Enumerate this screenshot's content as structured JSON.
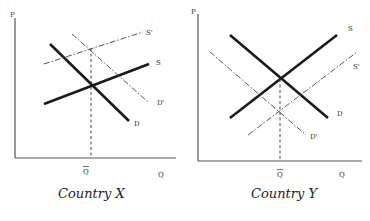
{
  "panels": [
    {
      "caption": "Country X",
      "y_axis_label": "P",
      "x_axis_label": "Q",
      "qbar_label": "Q",
      "curves": {
        "D": "D",
        "S": "S",
        "S_prime": "S'",
        "D_prime": "D'"
      }
    },
    {
      "caption": "Country Y",
      "y_axis_label": "P",
      "x_axis_label": "Q",
      "qbar_label": "Q",
      "curves": {
        "D": "D",
        "S": "S",
        "S_prime": "S'",
        "D_prime": "D'"
      }
    }
  ],
  "colors": {
    "solid_line": "#1a1a1a",
    "dashed_line": "#555555",
    "background": "#ffffff"
  }
}
